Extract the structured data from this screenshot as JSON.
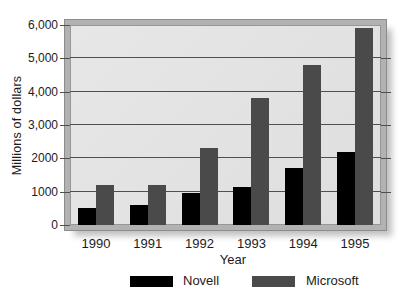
{
  "figure": {
    "kind": "grouped-bar-chart",
    "background": "#ffffff"
  },
  "colors": {
    "novell_bar": "#000000",
    "microsoft_bar": "#4a4a4a",
    "plot_background": "#e2e2e2",
    "gridline": "#4f4f4f",
    "frame": "#b2b2b2",
    "shadow": "#c0c0c0",
    "text": "#1c1c1c"
  },
  "chart_data": {
    "type": "bar",
    "title": "",
    "xlabel": "Year",
    "ylabel": "Millions of dollars",
    "categories": [
      "1990",
      "1991",
      "1992",
      "1993",
      "1994",
      "1995"
    ],
    "series": [
      {
        "name": "Novell",
        "color": "#000000",
        "values": [
          500,
          600,
          950,
          1150,
          1700,
          2200
        ]
      },
      {
        "name": "Microsoft",
        "color": "#4a4a4a",
        "values": [
          1200,
          1200,
          2300,
          3800,
          4800,
          5900
        ]
      }
    ],
    "ylim": [
      0,
      6000
    ],
    "ytick_interval": 1000,
    "ytick_labels": [
      "0",
      "1000",
      "2000",
      "3,000",
      "4,000",
      "5,000",
      "6,000"
    ],
    "grid": "horizontal",
    "legend_position": "bottom"
  }
}
